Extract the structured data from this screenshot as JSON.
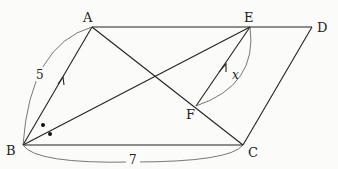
{
  "figure": {
    "type": "geometry",
    "shape": "parallelogram ABCD",
    "points": {
      "A": {
        "label": "A",
        "x": 92,
        "y": 27
      },
      "E": {
        "label": "E",
        "x": 250,
        "y": 27
      },
      "D": {
        "label": "D",
        "x": 312,
        "y": 27
      },
      "B": {
        "label": "B",
        "x": 23,
        "y": 145
      },
      "C": {
        "label": "C",
        "x": 243,
        "y": 145
      },
      "F": {
        "label": "F",
        "x": 196,
        "y": 106
      }
    },
    "segments": [
      "A-D",
      "A-B",
      "B-C",
      "C-D",
      "A-C",
      "B-E",
      "F-E"
    ],
    "measurements": {
      "AB": "5",
      "BC": "7",
      "angle": "x"
    },
    "annotations": {
      "parallel_marks": "AB ∥ FE",
      "equal_angle_marks": "two dots at B (BE bisects angle ABC)"
    }
  }
}
